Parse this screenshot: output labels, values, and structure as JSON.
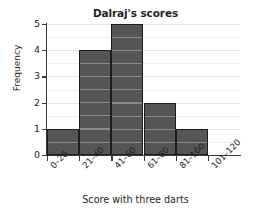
{
  "chart_data": {
    "type": "bar",
    "title": "Dalraj's scores",
    "xlabel": "Score with three darts",
    "ylabel": "Frequency",
    "categories": [
      "0–20",
      "21–40",
      "41–60",
      "61–80",
      "81–100",
      "101–120"
    ],
    "values": [
      1,
      4,
      5,
      2,
      1,
      0
    ],
    "ylim": [
      0,
      5
    ],
    "yticks": [
      0,
      1,
      2,
      3,
      4,
      5
    ],
    "ytick_labels": [
      "0",
      "1",
      "2",
      "3",
      "4",
      "5"
    ],
    "grid": true,
    "grid_minor_step": 0.5,
    "legend": null,
    "bar_color": "#555555",
    "bar_edge_color": "#1c1c1c",
    "grid_color": "#ededed",
    "axis_color": "#3a3a3a",
    "text_color": "#231f20",
    "background": "#ffffff"
  }
}
